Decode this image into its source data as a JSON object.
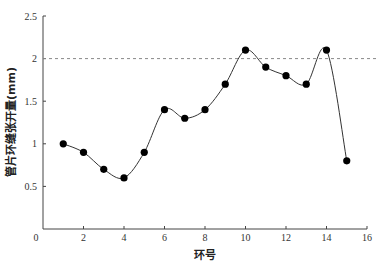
{
  "chart_data": {
    "type": "line",
    "title": "",
    "xlabel": "环号",
    "ylabel": "管片环缝张开量(mm)",
    "xlim": [
      0,
      16
    ],
    "ylim": [
      0,
      2.5
    ],
    "xticks": [
      0,
      2,
      4,
      6,
      8,
      10,
      12,
      14,
      16
    ],
    "yticks": [
      0.5,
      1,
      1.5,
      2,
      2.5
    ],
    "xtick_labels": [
      "0",
      "2",
      "4",
      "6",
      "8",
      "10",
      "12",
      "14",
      "16"
    ],
    "ytick_labels": [
      "0.5",
      "1",
      "1.5",
      "2",
      "2.5"
    ],
    "grid": false,
    "smooth": true,
    "reference_line": {
      "y": 2,
      "style": "dashed",
      "color": "#888888"
    },
    "series": [
      {
        "name": "管片环缝张开量",
        "color": "#000000",
        "x": [
          1,
          2,
          3,
          4,
          5,
          6,
          7,
          8,
          9,
          10,
          11,
          12,
          13,
          14,
          15
        ],
        "values": [
          1.0,
          0.9,
          0.7,
          0.6,
          0.9,
          1.4,
          1.3,
          1.4,
          1.7,
          2.1,
          1.9,
          1.8,
          1.7,
          2.1,
          0.8
        ]
      }
    ]
  }
}
